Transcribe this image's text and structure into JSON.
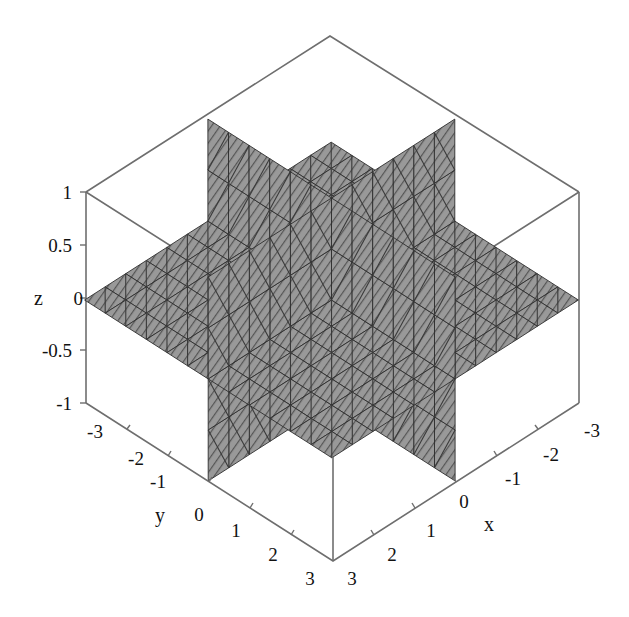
{
  "chart_data": {
    "type": "surface3d",
    "title": "",
    "surfaces": [
      {
        "name": "plane x=0",
        "fixed_axis": "x",
        "value": 0,
        "range_u": [
          -3,
          3
        ],
        "range_v": [
          -1,
          1
        ]
      },
      {
        "name": "plane y=0",
        "fixed_axis": "y",
        "value": 0,
        "range_u": [
          -3,
          3
        ],
        "range_v": [
          -1,
          1
        ]
      },
      {
        "name": "plane z=0",
        "fixed_axis": "z",
        "value": 0,
        "range_u": [
          -3,
          3
        ],
        "range_v": [
          -3,
          3
        ]
      }
    ],
    "axes": {
      "x": {
        "label": "x",
        "range": [
          -3,
          3
        ],
        "ticks": [
          -3,
          -2,
          -1,
          0,
          1,
          2,
          3
        ]
      },
      "y": {
        "label": "y",
        "range": [
          -3,
          3
        ],
        "ticks": [
          -3,
          -2,
          -1,
          0,
          1,
          2,
          3
        ]
      },
      "z": {
        "label": "z",
        "range": [
          -1,
          1
        ],
        "ticks": [
          -1,
          -0.5,
          0,
          0.5,
          1
        ]
      }
    },
    "grid": false,
    "legend": null,
    "style": {
      "surface_fill": "#8f8f8f",
      "surface_fill_light": "#a6a6a6",
      "mesh_color": "#333333",
      "box_color": "#6e6e6e",
      "background": "#ffffff"
    },
    "mesh_divisions": 12,
    "projection": {
      "origin": [
        331.5,
        300
      ],
      "ex": [
        -41.1,
        26.3
      ],
      "ey": [
        41.2,
        26.3
      ],
      "ez": [
        0,
        -102
      ]
    }
  },
  "labels": {
    "x_axis_name": "x",
    "y_axis_name": "y",
    "z_axis_name": "z",
    "z_ticks": [
      "1",
      "0.5",
      "0",
      "-0.5",
      "-1"
    ],
    "y_ticks": [
      "-3",
      "-2",
      "-1",
      "0",
      "1",
      "2",
      "3"
    ],
    "x_ticks": [
      "3",
      "2",
      "1",
      "0",
      "-1",
      "-2",
      "-3"
    ]
  }
}
